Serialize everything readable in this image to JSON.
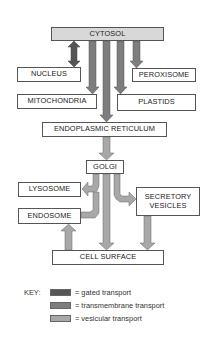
{
  "diagram": {
    "compartments": {
      "cytosol": "CYTOSOL",
      "nucleus": "NUCLEUS",
      "peroxisome": "PEROXISOME",
      "mitochondria": "MITOCHONDRIA",
      "plastids": "PLASTIDS",
      "er": "ENDOPLASMIC RETICULUM",
      "golgi": "GOLGI",
      "lysosome": "LYSOSOME",
      "secretory_vesicles": "SECRETORY VESICLES",
      "endosome": "ENDOSOME",
      "cell_surface": "CELL SURFACE"
    },
    "colors": {
      "gated": "#555555",
      "transmembrane": "#7d7d7d",
      "vesicular": "#a8a8a8",
      "cytosol_fill": "#d8d8d8"
    },
    "arrows": [
      {
        "from": "CYTOSOL",
        "to": "NUCLEUS",
        "type": "gated",
        "bidirectional": true
      },
      {
        "from": "CYTOSOL",
        "to": "MITOCHONDRIA",
        "type": "transmembrane"
      },
      {
        "from": "CYTOSOL",
        "to": "ENDOPLASMIC RETICULUM",
        "type": "transmembrane"
      },
      {
        "from": "CYTOSOL",
        "to": "PLASTIDS",
        "type": "transmembrane"
      },
      {
        "from": "CYTOSOL",
        "to": "PEROXISOME",
        "type": "transmembrane"
      },
      {
        "from": "ENDOPLASMIC RETICULUM",
        "to": "GOLGI",
        "type": "vesicular"
      },
      {
        "from": "GOLGI",
        "to": "LYSOSOME",
        "type": "vesicular"
      },
      {
        "from": "ENDOSOME",
        "to": "LYSOSOME",
        "type": "vesicular"
      },
      {
        "from": "GOLGI",
        "to": "SECRETORY VESICLES",
        "type": "vesicular"
      },
      {
        "from": "GOLGI",
        "to": "CELL SURFACE",
        "type": "vesicular"
      },
      {
        "from": "SECRETORY VESICLES",
        "to": "CELL SURFACE",
        "type": "vesicular"
      },
      {
        "from": "CELL SURFACE",
        "to": "ENDOSOME",
        "type": "vesicular"
      }
    ]
  },
  "key": {
    "title": "KEY:",
    "items": [
      {
        "label": "= gated transport",
        "color": "#555555"
      },
      {
        "label": "= transmembrane transport",
        "color": "#7d7d7d"
      },
      {
        "label": "= vesicular transport",
        "color": "#a8a8a8"
      }
    ]
  }
}
